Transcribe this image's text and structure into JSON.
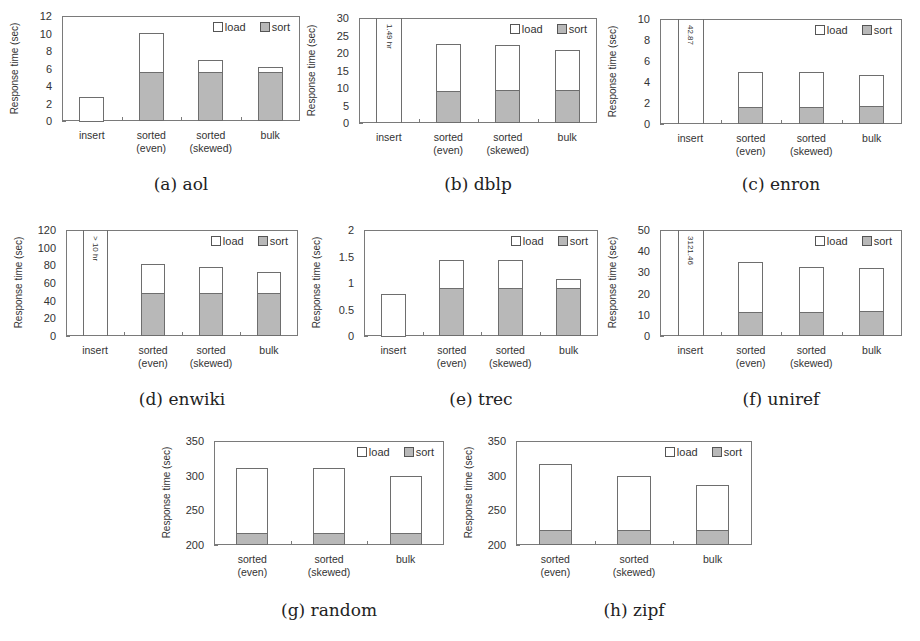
{
  "chart_data": [
    {
      "id": "a",
      "caption": "(a) aol",
      "type": "bar",
      "stacked": true,
      "title": "",
      "xlabel": "",
      "ylabel": "Response time (sec)",
      "ylim": [
        0,
        12
      ],
      "yticks": [
        "0",
        "2",
        "4",
        "6",
        "8",
        "10",
        "12"
      ],
      "categories": [
        "insert",
        "sorted\n(even)",
        "sorted\n(skewed)",
        "bulk"
      ],
      "series": [
        {
          "name": "sort",
          "color": "#b8b8b8",
          "values": [
            0,
            5.6,
            5.6,
            5.6
          ]
        },
        {
          "name": "load",
          "color": "#ffffff",
          "values": [
            2.8,
            4.5,
            1.4,
            0.6
          ]
        }
      ],
      "totals": [
        2.8,
        10.1,
        7.0,
        6.2
      ],
      "annotations": [],
      "legend": {
        "position": "top-right",
        "entries": [
          "load",
          "sort"
        ]
      }
    },
    {
      "id": "b",
      "caption": "(b) dblp",
      "type": "bar",
      "stacked": true,
      "title": "",
      "xlabel": "",
      "ylabel": "Response time (sec)",
      "ylim": [
        0,
        30
      ],
      "yticks": [
        "0",
        "5",
        "10",
        "15",
        "20",
        "25",
        "30"
      ],
      "categories": [
        "insert",
        "sorted\n(even)",
        "sorted\n(skewed)",
        "bulk"
      ],
      "series": [
        {
          "name": "sort",
          "color": "#b8b8b8",
          "values": [
            0,
            9.2,
            9.3,
            9.3
          ]
        },
        {
          "name": "load",
          "color": "#ffffff",
          "values": [
            30,
            13.4,
            13.0,
            11.5
          ]
        }
      ],
      "totals": [
        30,
        22.6,
        22.3,
        20.8
      ],
      "annotations": [
        {
          "category": "insert",
          "text": "1.49 hr",
          "note": "bar exceeds axis"
        }
      ],
      "legend": {
        "position": "top-right",
        "entries": [
          "load",
          "sort"
        ]
      }
    },
    {
      "id": "c",
      "caption": "(c) enron",
      "type": "bar",
      "stacked": true,
      "title": "",
      "xlabel": "",
      "ylabel": "Response time (sec)",
      "ylim": [
        0,
        10
      ],
      "yticks": [
        "0",
        "2",
        "4",
        "6",
        "8",
        "10"
      ],
      "categories": [
        "insert",
        "sorted\n(even)",
        "sorted\n(skewed)",
        "bulk"
      ],
      "series": [
        {
          "name": "sort",
          "color": "#b8b8b8",
          "values": [
            0,
            1.6,
            1.6,
            1.7
          ]
        },
        {
          "name": "load",
          "color": "#ffffff",
          "values": [
            10,
            3.4,
            3.4,
            3.0
          ]
        }
      ],
      "totals": [
        10,
        5.0,
        5.0,
        4.7
      ],
      "annotations": [
        {
          "category": "insert",
          "text": "42.87",
          "note": "bar exceeds axis"
        }
      ],
      "legend": {
        "position": "top-right",
        "entries": [
          "load",
          "sort"
        ]
      }
    },
    {
      "id": "d",
      "caption": "(d) enwiki",
      "type": "bar",
      "stacked": true,
      "title": "",
      "xlabel": "",
      "ylabel": "Response time (sec)",
      "ylim": [
        0,
        120
      ],
      "yticks": [
        "0",
        "20",
        "40",
        "60",
        "80",
        "100",
        "120"
      ],
      "categories": [
        "insert",
        "sorted\n(even)",
        "sorted\n(skewed)",
        "bulk"
      ],
      "series": [
        {
          "name": "sort",
          "color": "#b8b8b8",
          "values": [
            0,
            49,
            49,
            49
          ]
        },
        {
          "name": "load",
          "color": "#ffffff",
          "values": [
            120,
            33,
            29,
            23
          ]
        }
      ],
      "totals": [
        120,
        82,
        78,
        72
      ],
      "annotations": [
        {
          "category": "insert",
          "text": "> 10 hr",
          "note": "bar exceeds axis"
        }
      ],
      "legend": {
        "position": "top-right",
        "entries": [
          "load",
          "sort"
        ]
      }
    },
    {
      "id": "e",
      "caption": "(e) trec",
      "type": "bar",
      "stacked": true,
      "title": "",
      "xlabel": "",
      "ylabel": "Response time (sec)",
      "ylim": [
        0,
        2
      ],
      "yticks": [
        "0",
        "0.5",
        "1",
        "1.5",
        "2"
      ],
      "categories": [
        "insert",
        "sorted\n(even)",
        "sorted\n(skewed)",
        "bulk"
      ],
      "series": [
        {
          "name": "sort",
          "color": "#b8b8b8",
          "values": [
            0,
            0.9,
            0.9,
            0.9
          ]
        },
        {
          "name": "load",
          "color": "#ffffff",
          "values": [
            0.8,
            0.54,
            0.53,
            0.17
          ]
        }
      ],
      "totals": [
        0.8,
        1.44,
        1.43,
        1.07
      ],
      "annotations": [],
      "legend": {
        "position": "top-right",
        "entries": [
          "load",
          "sort"
        ]
      }
    },
    {
      "id": "f",
      "caption": "(f) uniref",
      "type": "bar",
      "stacked": true,
      "title": "",
      "xlabel": "",
      "ylabel": "Response time (sec)",
      "ylim": [
        0,
        50
      ],
      "yticks": [
        "0",
        "10",
        "20",
        "30",
        "40",
        "50"
      ],
      "categories": [
        "insert",
        "sorted\n(even)",
        "sorted\n(skewed)",
        "bulk"
      ],
      "series": [
        {
          "name": "sort",
          "color": "#b8b8b8",
          "values": [
            0,
            11.5,
            11.5,
            11.8
          ]
        },
        {
          "name": "load",
          "color": "#ffffff",
          "values": [
            50,
            23.5,
            21.0,
            20.4
          ]
        }
      ],
      "totals": [
        50,
        35.0,
        32.5,
        32.2
      ],
      "annotations": [
        {
          "category": "insert",
          "text": "3121.46",
          "note": "bar exceeds axis"
        }
      ],
      "legend": {
        "position": "top-right",
        "entries": [
          "load",
          "sort"
        ]
      }
    },
    {
      "id": "g",
      "caption": "(g) random",
      "type": "bar",
      "stacked": true,
      "title": "",
      "xlabel": "",
      "ylabel": "Response time (sec)",
      "ylim": [
        200,
        350
      ],
      "yticks": [
        "200",
        "250",
        "300",
        "350"
      ],
      "categories": [
        "sorted\n(even)",
        "sorted\n(skewed)",
        "bulk"
      ],
      "series": [
        {
          "name": "sort",
          "color": "#b8b8b8",
          "values": [
            217,
            217,
            217
          ]
        },
        {
          "name": "load",
          "color": "#ffffff",
          "values": [
            94,
            94,
            82
          ]
        }
      ],
      "totals": [
        311,
        311,
        299
      ],
      "annotations": [],
      "legend": {
        "position": "top-right",
        "entries": [
          "load",
          "sort"
        ]
      }
    },
    {
      "id": "h",
      "caption": "(h) zipf",
      "type": "bar",
      "stacked": true,
      "title": "",
      "xlabel": "",
      "ylabel": "Response time (sec)",
      "ylim": [
        200,
        350
      ],
      "yticks": [
        "200",
        "250",
        "300",
        "350"
      ],
      "categories": [
        "sorted\n(even)",
        "sorted\n(skewed)",
        "bulk"
      ],
      "series": [
        {
          "name": "sort",
          "color": "#b8b8b8",
          "values": [
            222,
            222,
            222
          ]
        },
        {
          "name": "load",
          "color": "#ffffff",
          "values": [
            95,
            77,
            65
          ]
        }
      ],
      "totals": [
        317,
        299,
        287
      ],
      "annotations": [],
      "legend": {
        "position": "top-right",
        "entries": [
          "load",
          "sort"
        ]
      }
    }
  ],
  "layout": {
    "charts": [
      {
        "x": 0,
        "y": 0,
        "frame": {
          "left": 62,
          "top": 16,
          "width": 238,
          "height": 105
        },
        "caption_y": 174
      },
      {
        "x": 300,
        "y": 0,
        "frame": {
          "left": 59,
          "top": 18,
          "width": 238,
          "height": 105
        },
        "caption_y": 174
      },
      {
        "x": 600,
        "y": 0,
        "frame": {
          "left": 60,
          "top": 19,
          "width": 242,
          "height": 105
        },
        "caption_y": 174
      },
      {
        "x": 0,
        "y": 215,
        "frame": {
          "left": 66,
          "top": 15,
          "width": 232,
          "height": 106
        },
        "caption_y": 174
      },
      {
        "x": 300,
        "y": 215,
        "frame": {
          "left": 64,
          "top": 15,
          "width": 234,
          "height": 106
        },
        "caption_y": 174
      },
      {
        "x": 600,
        "y": 215,
        "frame": {
          "left": 60,
          "top": 15,
          "width": 242,
          "height": 106
        },
        "caption_y": 174
      },
      {
        "x": 150,
        "y": 430,
        "frame": {
          "left": 64,
          "top": 11,
          "width": 230,
          "height": 104
        },
        "caption_y": 170
      },
      {
        "x": 450,
        "y": 430,
        "frame": {
          "left": 66,
          "top": 11,
          "width": 236,
          "height": 104
        },
        "caption_y": 170
      }
    ]
  }
}
